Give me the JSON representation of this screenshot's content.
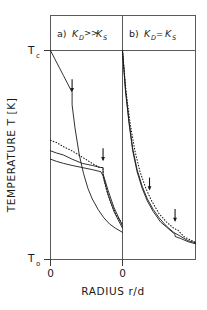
{
  "figure": {
    "name": "temperature-vs-radius-two-panel-plot",
    "axis": {
      "ylabel": "TEMPERATURE T  [K]",
      "xlabel": "RADIUS r/d",
      "ytick_top_label": "T",
      "ytick_top_sub": "c",
      "ytick_bottom_label": "T",
      "ytick_bottom_sub": "o",
      "xtick_left_label": "0",
      "xtick_center_label": "0"
    },
    "panels": [
      {
        "id": "a",
        "prefix": "a)",
        "cond_first": "K",
        "cond_first_sub": "D",
        "cond_rel": ">>",
        "cond_second": "K",
        "cond_second_sub": "S"
      },
      {
        "id": "b",
        "prefix": "b)",
        "cond_first": "K",
        "cond_first_sub": "D",
        "cond_rel": "=",
        "cond_second": "K",
        "cond_second_sub": "S"
      }
    ],
    "colors": {
      "line": "#1a1a1a",
      "frame": "#4a4a4a",
      "background": "#ffffff"
    }
  },
  "chart_data": {
    "type": "line",
    "title": "",
    "xlabel": "RADIUS r/d",
    "ylabel": "TEMPERATURE T  [K]",
    "xlim": [
      0,
      1
    ],
    "ylim": [
      "T_o",
      "T_c"
    ],
    "grid": false,
    "legend": null,
    "annotations": [
      {
        "type": "arrow",
        "panel": "a",
        "x": 0.3,
        "y": 0.8,
        "note": "melt front upper curve"
      },
      {
        "type": "arrow",
        "panel": "a",
        "x": 0.73,
        "y": 0.47,
        "note": "melt front lower curves"
      },
      {
        "type": "arrow",
        "panel": "b",
        "x": 0.37,
        "y": 0.33,
        "note": "melt front upper"
      },
      {
        "type": "arrow",
        "panel": "b",
        "x": 0.72,
        "y": 0.18,
        "note": "melt front lower"
      }
    ],
    "panels": [
      {
        "id": "a",
        "label": "a)  K_D >> K_S",
        "series": [
          {
            "name": "high-power solid",
            "style": "solid",
            "x": [
              0.0,
              0.06,
              0.12,
              0.18,
              0.24,
              0.3,
              0.3,
              0.34,
              0.4,
              0.46,
              0.52,
              0.58,
              0.66,
              0.74,
              0.82,
              0.9,
              1.0
            ],
            "y": [
              1.0,
              0.96,
              0.92,
              0.88,
              0.84,
              0.8,
              0.74,
              0.63,
              0.5,
              0.41,
              0.34,
              0.29,
              0.24,
              0.2,
              0.17,
              0.15,
              0.13
            ]
          },
          {
            "name": "low-power solid upper",
            "style": "solid",
            "x": [
              0.0,
              0.08,
              0.18,
              0.3,
              0.44,
              0.58,
              0.7,
              0.73,
              0.73,
              0.8,
              0.88,
              1.0
            ],
            "y": [
              0.52,
              0.51,
              0.5,
              0.48,
              0.46,
              0.45,
              0.44,
              0.44,
              0.41,
              0.33,
              0.25,
              0.16
            ]
          },
          {
            "name": "low-power solid lower",
            "style": "solid",
            "x": [
              0.0,
              0.08,
              0.18,
              0.3,
              0.44,
              0.58,
              0.7,
              0.73,
              0.8,
              0.88,
              1.0
            ],
            "y": [
              0.48,
              0.47,
              0.46,
              0.45,
              0.44,
              0.43,
              0.42,
              0.4,
              0.31,
              0.23,
              0.15
            ]
          },
          {
            "name": "dotted reference",
            "style": "dotted",
            "x": [
              0.0,
              0.08,
              0.18,
              0.3,
              0.44,
              0.58,
              0.68,
              0.73,
              0.73,
              0.78,
              0.84,
              0.92,
              1.0
            ],
            "y": [
              0.57,
              0.56,
              0.54,
              0.52,
              0.49,
              0.46,
              0.44,
              0.44,
              0.4,
              0.33,
              0.27,
              0.21,
              0.17
            ]
          }
        ]
      },
      {
        "id": "b",
        "label": "b)  K_D = K_S",
        "series": [
          {
            "name": "high-power solid",
            "style": "solid",
            "x": [
              0.0,
              0.04,
              0.09,
              0.14,
              0.2,
              0.27,
              0.34,
              0.42,
              0.5,
              0.6,
              0.7,
              0.8,
              0.9,
              1.0
            ],
            "y": [
              1.0,
              0.82,
              0.66,
              0.53,
              0.43,
              0.35,
              0.29,
              0.24,
              0.2,
              0.16,
              0.13,
              0.11,
              0.09,
              0.08
            ]
          },
          {
            "name": "low-power solid",
            "style": "solid",
            "x": [
              0.0,
              0.04,
              0.09,
              0.14,
              0.2,
              0.27,
              0.34,
              0.42,
              0.52,
              0.62,
              0.72,
              0.72,
              0.8,
              0.9,
              1.0
            ],
            "y": [
              1.0,
              0.81,
              0.65,
              0.52,
              0.42,
              0.34,
              0.28,
              0.23,
              0.18,
              0.15,
              0.12,
              0.11,
              0.1,
              0.085,
              0.075
            ]
          },
          {
            "name": "dotted reference",
            "style": "dotted",
            "x": [
              0.0,
              0.05,
              0.11,
              0.17,
              0.24,
              0.32,
              0.4,
              0.5,
              0.6,
              0.7,
              0.76,
              0.84,
              0.92,
              1.0
            ],
            "y": [
              1.0,
              0.8,
              0.64,
              0.52,
              0.42,
              0.34,
              0.28,
              0.22,
              0.18,
              0.15,
              0.14,
              0.11,
              0.095,
              0.082
            ]
          }
        ]
      }
    ]
  }
}
